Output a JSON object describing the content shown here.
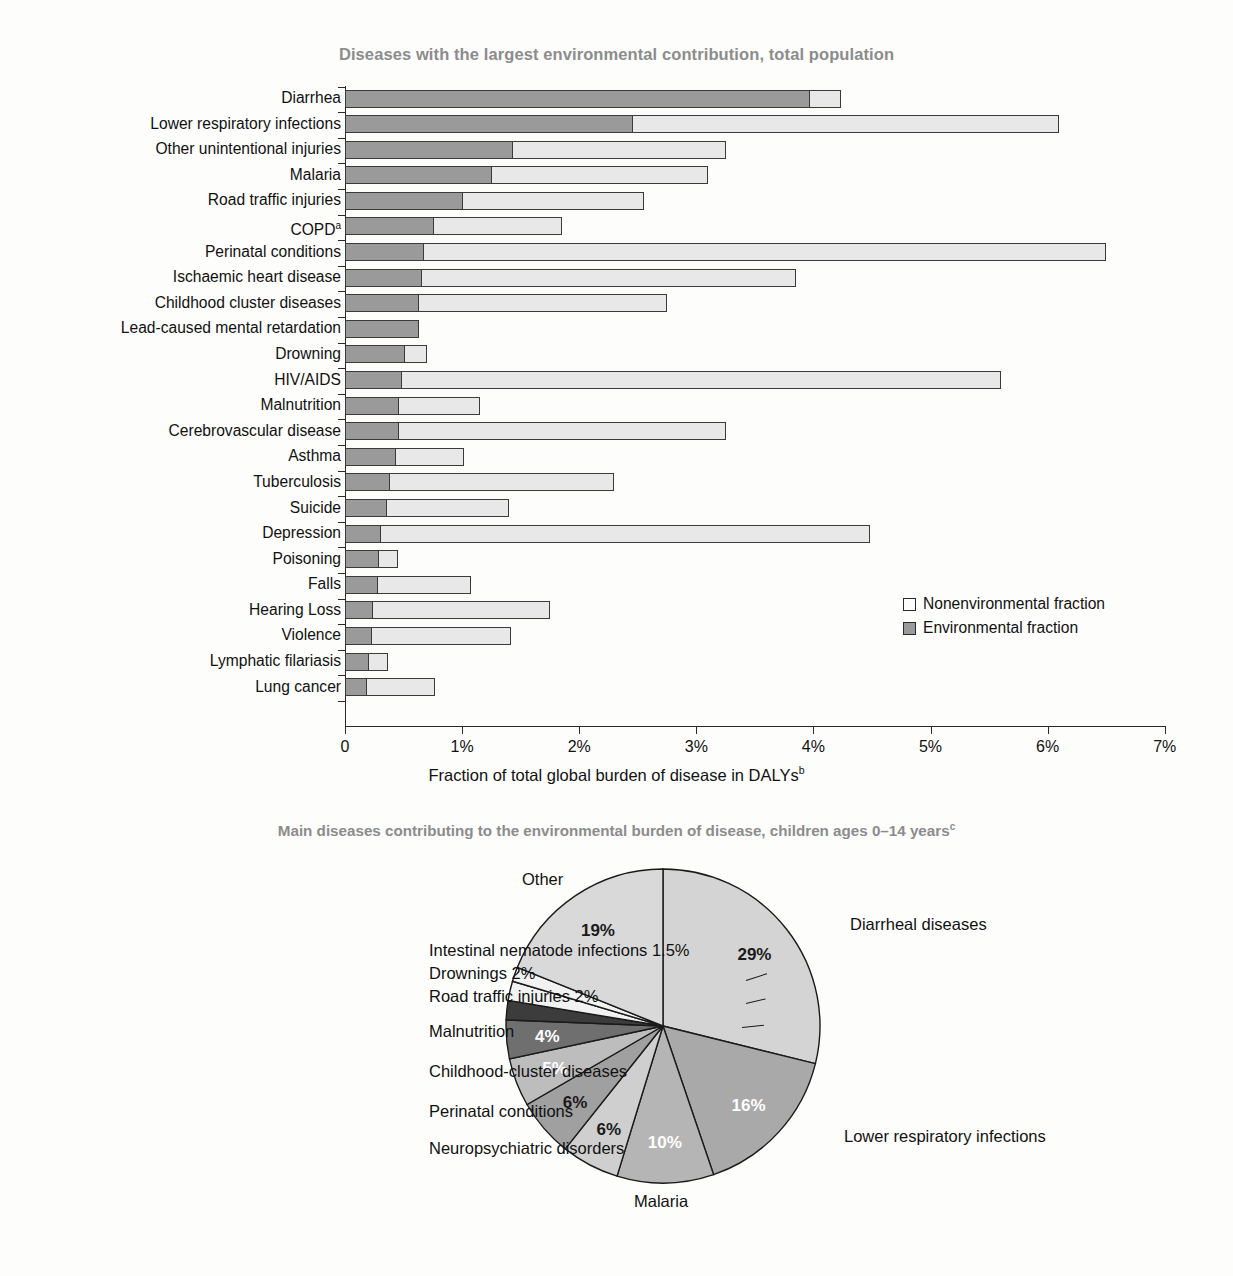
{
  "bar_section": {
    "title": "Diseases with the largest environmental contribution, total population",
    "xlabel": "Fraction of total global burden of disease in DALYs",
    "xlabel_sup": "b",
    "legend": {
      "nonenvironmental": "Nonenvironmental fraction",
      "environmental": "Environmental fraction"
    },
    "ticks": [
      "0",
      "1%",
      "2%",
      "3%",
      "4%",
      "5%",
      "6%",
      "7%"
    ]
  },
  "pie_section": {
    "title": "Main diseases contributing to the environmental burden of disease, children ages 0–14 years",
    "title_sup": "c"
  },
  "colors": {
    "environmental_fill": "#9a9a9a",
    "nonenvironmental_fill": "#e8e8e8",
    "stroke": "#3a3a3a",
    "title_gray": "#8c8c8c"
  },
  "chart_data": [
    {
      "type": "bar",
      "orientation": "horizontal",
      "stacked": true,
      "title": "Diseases with the largest environmental contribution, total population",
      "xlabel": "Fraction of total global burden of disease in DALYs (b)",
      "ylabel": "",
      "xlim": [
        0,
        7
      ],
      "xunit": "%",
      "grid": false,
      "legend_position": "middle-right",
      "categories": [
        "Diarrhea",
        "Lower respiratory infections",
        "Other unintentional injuries",
        "Malaria",
        "Road traffic injuries",
        "COPD",
        "Perinatal conditions",
        "Ischaemic heart disease",
        "Childhood cluster diseases",
        "Lead-caused mental retardation",
        "Drowning",
        "HIV/AIDS",
        "Malnutrition",
        "Cerebrovascular disease",
        "Asthma",
        "Tuberculosis",
        "Suicide",
        "Depression",
        "Poisoning",
        "Falls",
        "Hearing Loss",
        "Violence",
        "Lymphatic filariasis",
        "Lung cancer"
      ],
      "category_superscripts": {
        "COPD": "a"
      },
      "series": [
        {
          "name": "Environmental fraction",
          "color": "#9a9a9a",
          "values": [
            3.96,
            2.45,
            1.43,
            1.25,
            1.0,
            0.75,
            0.67,
            0.65,
            0.62,
            0.63,
            0.5,
            0.48,
            0.45,
            0.45,
            0.43,
            0.38,
            0.35,
            0.3,
            0.28,
            0.27,
            0.23,
            0.22,
            0.2,
            0.18
          ]
        },
        {
          "name": "Nonenvironmental fraction",
          "color": "#e8e8e8",
          "values": [
            0.28,
            3.65,
            1.82,
            1.85,
            1.55,
            1.1,
            5.83,
            3.2,
            2.13,
            0.0,
            0.2,
            5.12,
            0.7,
            2.8,
            0.59,
            1.92,
            1.05,
            4.18,
            0.17,
            0.81,
            1.52,
            1.2,
            0.17,
            0.59
          ]
        }
      ],
      "totals": [
        4.24,
        6.1,
        3.25,
        3.1,
        2.55,
        1.85,
        6.5,
        3.85,
        2.75,
        0.63,
        0.7,
        5.6,
        1.15,
        3.25,
        1.02,
        2.3,
        1.4,
        4.48,
        0.45,
        1.08,
        1.75,
        1.42,
        0.37,
        0.77
      ]
    },
    {
      "type": "pie",
      "title": "Main diseases contributing to the environmental burden of disease, children ages 0–14 years (c)",
      "unit": "%",
      "start_angle_deg": -90,
      "direction": "clockwise",
      "labels": [
        "Diarrheal diseases",
        "Lower respiratory infections",
        "Malaria",
        "Neuropsychiatric disorders",
        "Perinatal conditions",
        "Childhood-cluster diseases",
        "Malnutrition",
        "Road traffic injuries",
        "Drownings",
        "Intestinal nematode infections",
        "Other"
      ],
      "values": [
        29,
        16,
        10,
        6,
        6,
        5,
        4,
        2,
        2,
        1.5,
        19
      ],
      "value_labels": [
        "29%",
        "16%",
        "10%",
        "6%",
        "6%",
        "5%",
        "4%",
        "2%",
        "2%",
        "1.5%",
        "19%"
      ],
      "slice_colors": [
        "#d4d4d4",
        "#a9a9a9",
        "#b5b5b5",
        "#cfcfcf",
        "#a0a0a0",
        "#bdbdbd",
        "#6f6f6f",
        "#3c3c3c",
        "#f2f2f2",
        "#f2f2f2",
        "#d9d9d9"
      ],
      "value_label_color": [
        "#1a1a1a",
        "#ffffff",
        "#ffffff",
        "#1a1a1a",
        "#1a1a1a",
        "#ffffff",
        "#ffffff",
        "",
        "",
        "",
        "#1a1a1a"
      ]
    }
  ]
}
